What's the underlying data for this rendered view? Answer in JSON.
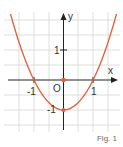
{
  "figure": {
    "caption": "Fig. 1",
    "function": "y = x^2 - 1",
    "axes": {
      "x_label": "x",
      "y_label": "y",
      "origin_label": "O"
    },
    "tick_labels": {
      "x_neg": "-1",
      "x_pos": "1",
      "y_pos": "1",
      "y_neg": "-1"
    },
    "colors": {
      "curve": "#e0603c",
      "grid": "#d4d4d4",
      "axis": "#222222",
      "text": "#333333"
    }
  }
}
